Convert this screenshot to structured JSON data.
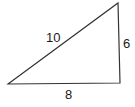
{
  "diagram": {
    "type": "right-triangle",
    "sides": {
      "hypotenuse": "10",
      "vertical": "6",
      "base": "8"
    },
    "stroke_color": "#333333"
  }
}
